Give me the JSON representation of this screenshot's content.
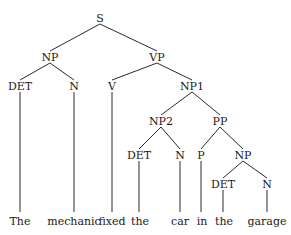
{
  "diagram": {
    "type": "parse-tree",
    "nodes": [
      {
        "id": "S",
        "label": "S",
        "x": 100,
        "y": 18
      },
      {
        "id": "NP",
        "label": "NP",
        "x": 50,
        "y": 57
      },
      {
        "id": "VP",
        "label": "VP",
        "x": 157,
        "y": 57
      },
      {
        "id": "DET1",
        "label": "DET",
        "x": 20,
        "y": 86
      },
      {
        "id": "N1",
        "label": "N",
        "x": 74,
        "y": 86
      },
      {
        "id": "V",
        "label": "V",
        "x": 112,
        "y": 86
      },
      {
        "id": "NP1",
        "label": "NP1",
        "x": 192,
        "y": 86
      },
      {
        "id": "NP2",
        "label": "NP2",
        "x": 161,
        "y": 121
      },
      {
        "id": "PP",
        "label": "PP",
        "x": 220,
        "y": 121
      },
      {
        "id": "DET2",
        "label": "DET",
        "x": 139,
        "y": 155
      },
      {
        "id": "N2",
        "label": "N",
        "x": 180,
        "y": 155
      },
      {
        "id": "P",
        "label": "P",
        "x": 201,
        "y": 155
      },
      {
        "id": "NP3",
        "label": "NP",
        "x": 243,
        "y": 155
      },
      {
        "id": "DET3",
        "label": "DET",
        "x": 223,
        "y": 184
      },
      {
        "id": "N3",
        "label": "N",
        "x": 267,
        "y": 184
      }
    ],
    "edges": [
      {
        "from": "S",
        "to": "NP"
      },
      {
        "from": "S",
        "to": "VP"
      },
      {
        "from": "NP",
        "to": "DET1"
      },
      {
        "from": "NP",
        "to": "N1"
      },
      {
        "from": "VP",
        "to": "V"
      },
      {
        "from": "VP",
        "to": "NP1"
      },
      {
        "from": "NP1",
        "to": "NP2"
      },
      {
        "from": "NP1",
        "to": "PP"
      },
      {
        "from": "NP2",
        "to": "DET2"
      },
      {
        "from": "NP2",
        "to": "N2"
      },
      {
        "from": "PP",
        "to": "P"
      },
      {
        "from": "PP",
        "to": "NP3"
      },
      {
        "from": "NP3",
        "to": "DET3"
      },
      {
        "from": "NP3",
        "to": "N3"
      }
    ],
    "words": [
      {
        "text": "The",
        "parent": "DET1",
        "x": 20,
        "y": 221
      },
      {
        "text": "mechanic",
        "parent": "N1",
        "x": 74,
        "y": 221
      },
      {
        "text": "fixed",
        "parent": "V",
        "x": 112,
        "y": 221
      },
      {
        "text": "the",
        "parent": "DET2",
        "x": 140,
        "y": 221
      },
      {
        "text": "car",
        "parent": "N2",
        "x": 180,
        "y": 221
      },
      {
        "text": "in",
        "parent": "P",
        "x": 202,
        "y": 221
      },
      {
        "text": "the",
        "parent": "DET3",
        "x": 224,
        "y": 221
      },
      {
        "text": "garage",
        "parent": "N3",
        "x": 267,
        "y": 221
      }
    ],
    "sentence": "The mechanic fixed the car in the garage"
  }
}
